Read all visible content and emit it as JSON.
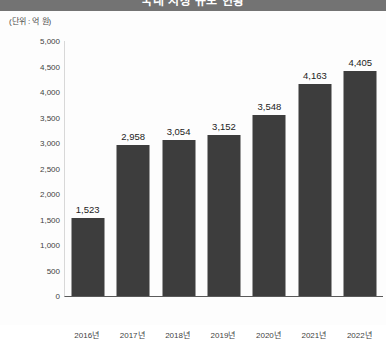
{
  "header": {
    "title": "국내 시장 규모 현황",
    "title_clipped": true
  },
  "chart_data": {
    "type": "bar",
    "title": "국내 시장 규모 현황",
    "unit_label": "(단위 : 억 원)",
    "xlabel": "",
    "ylabel": "",
    "categories": [
      "2016년",
      "2017년",
      "2018년",
      "2019년",
      "2020년",
      "2021년",
      "2022년"
    ],
    "values": [
      1523,
      2958,
      3054,
      3152,
      3548,
      4163,
      4405
    ],
    "value_labels": [
      "1,523",
      "2,958",
      "3,054",
      "3,152",
      "3,548",
      "4,163",
      "4,405"
    ],
    "ylim": [
      0,
      5000
    ],
    "ytick_values": [
      5000,
      4500,
      4000,
      3500,
      3000,
      2500,
      2000,
      1500,
      1000,
      500,
      0
    ],
    "ytick_labels": [
      "5,000",
      "4,500",
      "4,000",
      "3,500",
      "3,000",
      "2,500",
      "2,000",
      "1,500",
      "1,000",
      "500",
      "0"
    ],
    "grid": false,
    "legend": false,
    "bar_color": "#3d3d3d",
    "background_color": "#fdfdfd",
    "title_band_color": "#737373",
    "axis_color": "#5a5a5a"
  }
}
